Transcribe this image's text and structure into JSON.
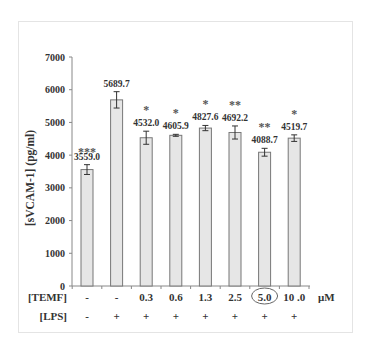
{
  "chart_data": {
    "type": "bar",
    "title": "",
    "ylabel": "[sVCAM-1] (pg/ml)",
    "xlabel": "",
    "ylim": [
      0,
      7000
    ],
    "yticks": [
      0,
      1000,
      2000,
      3000,
      4000,
      5000,
      6000,
      7000
    ],
    "grid": false,
    "categories": [
      "-/-",
      "-/+",
      "0.3/+",
      "0.6/+",
      "1.3/+",
      "2.5/+",
      "5.0/+",
      "10.0/+"
    ],
    "values": [
      3559.0,
      5689.7,
      4532.0,
      4605.9,
      4827.6,
      4692.2,
      4088.7,
      4519.7
    ],
    "value_labels": [
      "3559.0",
      "5689.7",
      "4532.0",
      "4605.9",
      "4827.6",
      "4692.2",
      "4088.7",
      "4519.7"
    ],
    "errors": [
      150,
      250,
      200,
      30,
      80,
      200,
      120,
      100
    ],
    "significance": [
      "***",
      "",
      "*",
      "*",
      "*",
      "**",
      "**",
      "*"
    ],
    "rows": [
      {
        "label": "[TEMF]",
        "values": [
          "-",
          "-",
          "0.3",
          "0.6",
          "1.3",
          "2.5",
          "5.0",
          "10 .0"
        ],
        "unit": "μM"
      },
      {
        "label": "[LPS]",
        "values": [
          "-",
          "+",
          "+",
          "+",
          "+",
          "+",
          "+",
          "+"
        ],
        "unit": ""
      }
    ],
    "highlighted_index": 6,
    "bar_color": "#e6e6e6",
    "bar_edge_color": "#777777"
  }
}
